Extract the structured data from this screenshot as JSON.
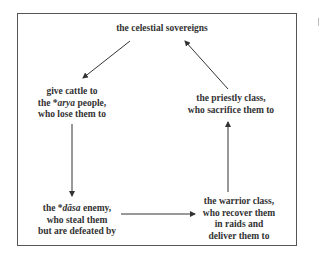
{
  "diagram": {
    "type": "cycle",
    "nodes": [
      {
        "id": "celestial",
        "lines": [
          "the celestial sovereigns"
        ]
      },
      {
        "id": "arya",
        "lines": [
          "give cattle to",
          "the *arya people,",
          "who lose them to"
        ],
        "italic_term": "arya"
      },
      {
        "id": "dasa",
        "lines": [
          "the *dāsa enemy,",
          "who steal them",
          "but are defeated by"
        ],
        "italic_term": "dāsa"
      },
      {
        "id": "warrior",
        "lines": [
          "the warrior class,",
          "who recover them",
          "in raids and",
          "deliver them to"
        ]
      },
      {
        "id": "priestly",
        "lines": [
          "the priestly class,",
          "who sacrifice them to"
        ]
      }
    ],
    "edges": [
      {
        "from": "celestial",
        "to": "arya"
      },
      {
        "from": "arya",
        "to": "dasa"
      },
      {
        "from": "dasa",
        "to": "warrior"
      },
      {
        "from": "warrior",
        "to": "priestly"
      },
      {
        "from": "priestly",
        "to": "celestial"
      }
    ],
    "text": {
      "celestial_1": "the celestial sovereigns",
      "arya_1": "give cattle to",
      "arya_2a": "the *",
      "arya_2b": "arya",
      "arya_2c": " people,",
      "arya_3": "who lose them to",
      "dasa_1a": "the *",
      "dasa_1b": "dāsa",
      "dasa_1c": " enemy,",
      "dasa_2": "who steal them",
      "dasa_3": "but are defeated by",
      "warrior_1": "the warrior class,",
      "warrior_2": "who recover them",
      "warrior_3": "in raids and",
      "warrior_4": "deliver them to",
      "priestly_1": "the priestly class,",
      "priestly_2": "who sacrifice them to"
    }
  }
}
